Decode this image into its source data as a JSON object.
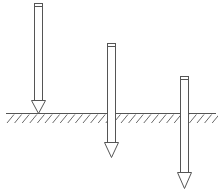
{
  "diagram": {
    "type": "arrows-penetrating-ground",
    "stroke_color": "#555555",
    "background": "#ffffff",
    "ground": {
      "y": 113.5,
      "x_start": 6,
      "x_end": 216,
      "hatch_depth": 9,
      "hatch_spacing": 7.6
    },
    "arrows": [
      {
        "id": 1,
        "label": "",
        "shaft_left": 34,
        "shaft_right": 42,
        "top": 3,
        "head_start": 100,
        "tip": 113,
        "head_half_width": 7
      },
      {
        "id": 2,
        "label": "",
        "shaft_left": 107,
        "shaft_right": 115,
        "top": 43,
        "head_start": 142,
        "tip": 157,
        "head_half_width": 7
      },
      {
        "id": 3,
        "label": "",
        "shaft_left": 180,
        "shaft_right": 188,
        "top": 76,
        "head_start": 172,
        "tip": 188,
        "head_half_width": 7
      }
    ]
  }
}
